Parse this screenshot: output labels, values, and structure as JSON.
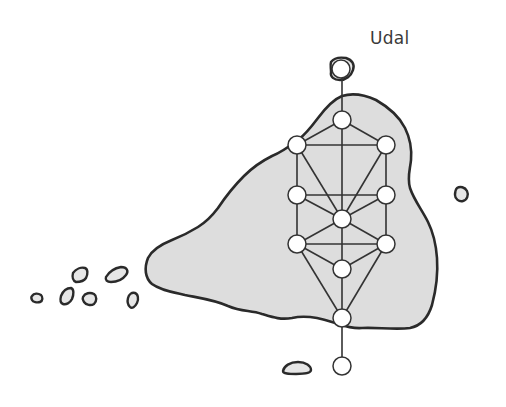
{
  "diagram": {
    "title": "Udal",
    "island_label": "Udal",
    "colors": {
      "land_fill": "#dddddd",
      "outline": "#2a2a2a",
      "node_fill": "#ffffff",
      "edge": "#333333"
    },
    "nodes": [
      {
        "id": "n0",
        "x": 341,
        "y": 69
      },
      {
        "id": "n1",
        "x": 342,
        "y": 120
      },
      {
        "id": "n2",
        "x": 297,
        "y": 145
      },
      {
        "id": "n3",
        "x": 386,
        "y": 145
      },
      {
        "id": "n4",
        "x": 297,
        "y": 195
      },
      {
        "id": "n5",
        "x": 386,
        "y": 195
      },
      {
        "id": "n6",
        "x": 342,
        "y": 219
      },
      {
        "id": "n7",
        "x": 297,
        "y": 244
      },
      {
        "id": "n8",
        "x": 386,
        "y": 244
      },
      {
        "id": "n9",
        "x": 342,
        "y": 269
      },
      {
        "id": "n10",
        "x": 342,
        "y": 318
      },
      {
        "id": "n11",
        "x": 342,
        "y": 366
      }
    ]
  }
}
